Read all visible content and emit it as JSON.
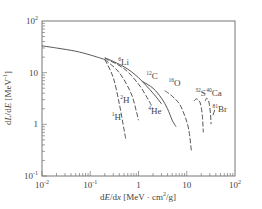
{
  "chart_data": {
    "type": "line",
    "title": "",
    "xlabel": "dE/dx [MeV·cm²/g]",
    "ylabel": "dL/dE [MeV⁻¹]",
    "xscale": "log",
    "yscale": "log",
    "xlim": [
      0.01,
      100
    ],
    "ylim": [
      0.1,
      100
    ],
    "grid": false,
    "legend": "none (inline labels)",
    "x_ticks": [
      {
        "value": 0.01,
        "label": "10",
        "sup": "-2"
      },
      {
        "value": 0.1,
        "label": "10",
        "sup": "-1"
      },
      {
        "value": 1,
        "label": "1",
        "sup": ""
      },
      {
        "value": 10,
        "label": "10",
        "sup": ""
      },
      {
        "value": 100,
        "label": "10",
        "sup": "2"
      }
    ],
    "y_ticks": [
      {
        "value": 100,
        "label": "10",
        "sup": "2"
      },
      {
        "value": 10,
        "label": "10",
        "sup": ""
      },
      {
        "value": 1,
        "label": "1",
        "sup": ""
      },
      {
        "value": 0.1,
        "label": "10",
        "sup": "-1"
      }
    ],
    "common_curve": {
      "x": [
        0.01,
        0.02,
        0.05,
        0.1,
        0.2
      ],
      "y": [
        33,
        30,
        26,
        22,
        18
      ]
    },
    "series": [
      {
        "name": "1H",
        "mass": "1",
        "symbol": "H",
        "style": "dashed",
        "x": [
          0.2,
          0.3,
          0.4,
          0.5,
          0.55
        ],
        "y": [
          18,
          8,
          2.5,
          0.8,
          0.5
        ],
        "label_pos": [
          0.28,
          1.2
        ]
      },
      {
        "name": "2H",
        "mass": "2",
        "symbol": "H",
        "style": "dashed",
        "x": [
          0.2,
          0.4,
          0.7,
          0.9,
          1.0
        ],
        "y": [
          18,
          10,
          4,
          1.8,
          1.2
        ],
        "label_pos": [
          0.42,
          2.6
        ]
      },
      {
        "name": "4He",
        "mass": "4",
        "symbol": "He",
        "style": "dashed",
        "x": [
          0.2,
          0.5,
          1.0,
          1.6,
          2.0
        ],
        "y": [
          19,
          12,
          6,
          3,
          2.0
        ],
        "label_pos": [
          1.6,
          1.6
        ]
      },
      {
        "name": "6Li",
        "mass": "6",
        "symbol": "Li",
        "style": "solid",
        "x": [
          0.2,
          0.5,
          1.0,
          2.0,
          3.0
        ],
        "y": [
          19.5,
          13,
          8,
          4,
          2.5
        ],
        "label_pos": [
          0.38,
          14
        ]
      },
      {
        "name": "12C",
        "mass": "12",
        "symbol": "C",
        "style": "solid",
        "x": [
          1.2,
          2.0,
          3.0,
          4.0,
          5.0,
          6.0
        ],
        "y": [
          6.8,
          5.0,
          3.2,
          2.0,
          1.2,
          0.9
        ],
        "label_pos": [
          1.45,
          7.6
        ]
      },
      {
        "name": "16O",
        "mass": "16",
        "symbol": "O",
        "style": "dashed",
        "x": [
          3.5,
          5.0,
          7.0,
          9.0,
          11.0,
          12.5
        ],
        "y": [
          4.5,
          3.5,
          2.5,
          1.5,
          0.8,
          0.3
        ],
        "label_pos": [
          4.2,
          5.5
        ]
      },
      {
        "name": "32S",
        "mass": "32",
        "symbol": "S",
        "style": "dashed",
        "x": [
          14,
          16,
          19,
          21,
          22
        ],
        "y": [
          2.8,
          3.1,
          2.6,
          1.5,
          0.7
        ],
        "label_pos": [
          15,
          3.6
        ]
      },
      {
        "name": "40Ca",
        "mass": "40",
        "symbol": "Ca",
        "style": "dashed",
        "x": [
          24,
          26,
          29,
          31,
          32
        ],
        "y": [
          2.8,
          3.2,
          2.6,
          1.6,
          1.0
        ],
        "label_pos": [
          25.5,
          3.6
        ]
      },
      {
        "name": "81Br",
        "mass": "81",
        "symbol": "Br",
        "style": "solid",
        "x": [
          35,
          38
        ],
        "y": [
          1.5,
          1.9
        ],
        "label_pos": [
          34,
          1.75
        ]
      }
    ]
  },
  "axes": {
    "x_title_pre": "d",
    "x_title_E": "E",
    "x_title_mid": "/d",
    "x_title_x": "x",
    "x_title_unit": " [MeV · cm",
    "x_title_sup": "2",
    "x_title_end": "/g]",
    "y_title_pre": "d",
    "y_title_L": "L",
    "y_title_mid": "/d",
    "y_title_E": "E",
    "y_title_unit": " [MeV",
    "y_title_sup": "-1",
    "y_title_end": "]"
  },
  "colors": {
    "frame": "#777777",
    "curve": "#444444",
    "text": "#444444"
  }
}
